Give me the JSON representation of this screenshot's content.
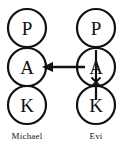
{
  "diagram": {
    "type": "pedigree-chain-diagram",
    "background_color": "#ffffff",
    "stroke_color": "#111111",
    "columns": [
      {
        "id": "michael",
        "person_label": "Michael",
        "label_x": 27,
        "label_y": 137,
        "center_x": 27,
        "nodes": [
          {
            "id": "michael-p",
            "letter": "P",
            "cx": 27,
            "cy": 28,
            "r": 19
          },
          {
            "id": "michael-a",
            "letter": "A",
            "cx": 27,
            "cy": 67,
            "r": 19
          },
          {
            "id": "michael-k",
            "letter": "K",
            "cx": 27,
            "cy": 105,
            "r": 19
          }
        ],
        "has_spine_line": false,
        "has_cross_mark": false
      },
      {
        "id": "evi",
        "person_label": "Evi",
        "label_x": 96,
        "label_y": 137,
        "center_x": 96,
        "nodes": [
          {
            "id": "evi-p",
            "letter": "P",
            "cx": 96,
            "cy": 28,
            "r": 19
          },
          {
            "id": "evi-a",
            "letter": "A",
            "cx": 96,
            "cy": 67,
            "r": 19
          },
          {
            "id": "evi-k",
            "letter": "K",
            "cx": 96,
            "cy": 105,
            "r": 19
          }
        ],
        "has_spine_line": true,
        "spine": {
          "x": 96,
          "y1": 10,
          "y2": 100
        },
        "has_cross_mark": true,
        "cross_mark": {
          "cx": 96,
          "cy": 82,
          "size": 6
        }
      }
    ],
    "arrow": {
      "id": "evi-a-to-michael-a",
      "from_node": "evi-a",
      "to_node": "michael-a",
      "direction": "left",
      "x_tail": 85,
      "x_tip": 42,
      "y": 67,
      "head_width": 9,
      "head_height": 10
    }
  }
}
